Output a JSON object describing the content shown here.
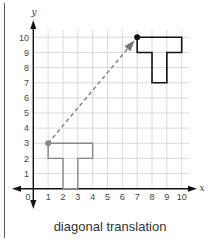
{
  "caption": "diagonal translation",
  "diagram": {
    "type": "coordinate-plane-translation",
    "axes": {
      "x_label": "x",
      "y_label": "y",
      "origin_label": "0",
      "x_ticks": [
        "1",
        "2",
        "3",
        "4",
        "5",
        "6",
        "7",
        "8",
        "9",
        "10"
      ],
      "y_ticks": [
        "1",
        "2",
        "3",
        "4",
        "5",
        "6",
        "7",
        "8",
        "9",
        "10"
      ],
      "xlim": [
        0,
        10
      ],
      "ylim": [
        0,
        10
      ],
      "grid": true
    },
    "original_shape": {
      "name": "T",
      "vertices": [
        [
          1,
          3
        ],
        [
          4,
          3
        ],
        [
          4,
          2
        ],
        [
          3,
          2
        ],
        [
          3,
          0
        ],
        [
          2,
          0
        ],
        [
          2,
          2
        ],
        [
          1,
          2
        ]
      ],
      "reference_point": [
        1,
        3
      ],
      "color": "#888888"
    },
    "translated_shape": {
      "name": "T",
      "vertices": [
        [
          7,
          10
        ],
        [
          10,
          10
        ],
        [
          10,
          9
        ],
        [
          9,
          9
        ],
        [
          9,
          7
        ],
        [
          8,
          7
        ],
        [
          8,
          9
        ],
        [
          7,
          9
        ]
      ],
      "reference_point": [
        7,
        10
      ],
      "color": "#111111"
    },
    "translation_arrow": {
      "from": [
        1,
        3
      ],
      "to": [
        7,
        10
      ],
      "style": "dashed",
      "color": "#888888"
    },
    "colors": {
      "grid": "#d2d2d2",
      "axis": "#111111",
      "border": "#555555"
    }
  }
}
